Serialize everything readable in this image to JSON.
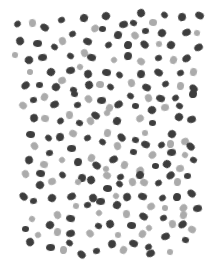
{
  "pattern": {
    "name": "spotted-pattern",
    "background": "#ffffff",
    "colors": {
      "dark": "#3d3d3d",
      "light": "#ababab"
    },
    "dot_size": {
      "dark": [
        8,
        7
      ],
      "light": [
        7,
        7
      ]
    },
    "dots": [
      [
        17,
        24,
        "d"
      ],
      [
        32,
        23,
        "l"
      ],
      [
        44,
        27,
        "d"
      ],
      [
        61,
        20,
        "d"
      ],
      [
        84,
        18,
        "d"
      ],
      [
        95,
        28,
        "l"
      ],
      [
        102,
        29,
        "d"
      ],
      [
        106,
        16,
        "d"
      ],
      [
        123,
        24,
        "d"
      ],
      [
        133,
        23,
        "d"
      ],
      [
        141,
        13,
        "d"
      ],
      [
        153,
        22,
        "l"
      ],
      [
        164,
        15,
        "d"
      ],
      [
        182,
        17,
        "d"
      ],
      [
        199,
        15,
        "d"
      ],
      [
        72,
        34,
        "d"
      ],
      [
        118,
        35,
        "d"
      ],
      [
        135,
        35,
        "l"
      ],
      [
        145,
        31,
        "d"
      ],
      [
        162,
        33,
        "d"
      ],
      [
        186,
        32,
        "d"
      ],
      [
        197,
        33,
        "l"
      ],
      [
        20,
        41,
        "d"
      ],
      [
        37,
        43,
        "d"
      ],
      [
        54,
        47,
        "d"
      ],
      [
        62,
        41,
        "l"
      ],
      [
        87,
        41,
        "d"
      ],
      [
        108,
        45,
        "d"
      ],
      [
        128,
        45,
        "d"
      ],
      [
        144,
        44,
        "d"
      ],
      [
        159,
        44,
        "l"
      ],
      [
        171,
        45,
        "d"
      ],
      [
        198,
        47,
        "d"
      ],
      [
        15,
        55,
        "l"
      ],
      [
        29,
        60,
        "d"
      ],
      [
        42,
        57,
        "d"
      ],
      [
        70,
        56,
        "d"
      ],
      [
        84,
        53,
        "l"
      ],
      [
        91,
        57,
        "d"
      ],
      [
        114,
        60,
        "l"
      ],
      [
        128,
        56,
        "d"
      ],
      [
        141,
        61,
        "l"
      ],
      [
        158,
        58,
        "d"
      ],
      [
        173,
        60,
        "l"
      ],
      [
        186,
        58,
        "d"
      ],
      [
        30,
        72,
        "l"
      ],
      [
        51,
        72,
        "d"
      ],
      [
        70,
        70,
        "d"
      ],
      [
        80,
        67,
        "l"
      ],
      [
        88,
        74,
        "d"
      ],
      [
        106,
        72,
        "d"
      ],
      [
        119,
        75,
        "d"
      ],
      [
        141,
        74,
        "d"
      ],
      [
        158,
        72,
        "d"
      ],
      [
        180,
        73,
        "d"
      ],
      [
        193,
        72,
        "l"
      ],
      [
        25,
        85,
        "d"
      ],
      [
        39,
        85,
        "d"
      ],
      [
        56,
        87,
        "d"
      ],
      [
        62,
        80,
        "l"
      ],
      [
        73,
        90,
        "d"
      ],
      [
        89,
        85,
        "d"
      ],
      [
        100,
        84,
        "l"
      ],
      [
        110,
        87,
        "d"
      ],
      [
        131,
        83,
        "l"
      ],
      [
        146,
        87,
        "d"
      ],
      [
        165,
        84,
        "d"
      ],
      [
        180,
        86,
        "l"
      ],
      [
        193,
        88,
        "d"
      ],
      [
        33,
        100,
        "d"
      ],
      [
        44,
        97,
        "l"
      ],
      [
        54,
        104,
        "d"
      ],
      [
        74,
        94,
        "d"
      ],
      [
        88,
        99,
        "l"
      ],
      [
        101,
        100,
        "d"
      ],
      [
        130,
        96,
        "d"
      ],
      [
        148,
        98,
        "l"
      ],
      [
        160,
        98,
        "d"
      ],
      [
        175,
        98,
        "d"
      ],
      [
        193,
        94,
        "d"
      ],
      [
        23,
        105,
        "l"
      ],
      [
        77,
        105,
        "d"
      ],
      [
        109,
        108,
        "l"
      ],
      [
        118,
        104,
        "d"
      ],
      [
        135,
        106,
        "d"
      ],
      [
        152,
        110,
        "d"
      ],
      [
        165,
        107,
        "l"
      ],
      [
        179,
        106,
        "d"
      ],
      [
        34,
        118,
        "d"
      ],
      [
        45,
        118,
        "l"
      ],
      [
        60,
        121,
        "d"
      ],
      [
        69,
        115,
        "l"
      ],
      [
        95,
        115,
        "d"
      ],
      [
        107,
        113,
        "l"
      ],
      [
        117,
        121,
        "d"
      ],
      [
        140,
        118,
        "l"
      ],
      [
        152,
        123,
        "d"
      ],
      [
        179,
        117,
        "d"
      ],
      [
        191,
        119,
        "d"
      ],
      [
        79,
        123,
        "d"
      ],
      [
        90,
        121,
        "l"
      ],
      [
        30,
        134,
        "d"
      ],
      [
        48,
        138,
        "d"
      ],
      [
        60,
        137,
        "d"
      ],
      [
        73,
        133,
        "l"
      ],
      [
        87,
        138,
        "d"
      ],
      [
        107,
        133,
        "l"
      ],
      [
        121,
        137,
        "d"
      ],
      [
        145,
        133,
        "l"
      ],
      [
        172,
        134,
        "d"
      ],
      [
        185,
        141,
        "l"
      ],
      [
        135,
        140,
        "d"
      ],
      [
        34,
        146,
        "l"
      ],
      [
        71,
        148,
        "d"
      ],
      [
        102,
        142,
        "d"
      ],
      [
        117,
        146,
        "l"
      ],
      [
        145,
        144,
        "d"
      ],
      [
        161,
        145,
        "d"
      ],
      [
        170,
        144,
        "l"
      ],
      [
        190,
        146,
        "d"
      ],
      [
        49,
        153,
        "d"
      ],
      [
        91,
        158,
        "l"
      ],
      [
        113,
        159,
        "d"
      ],
      [
        133,
        152,
        "d"
      ],
      [
        152,
        155,
        "l"
      ],
      [
        171,
        152,
        "d"
      ],
      [
        185,
        155,
        "l"
      ],
      [
        29,
        160,
        "d"
      ],
      [
        44,
        164,
        "l"
      ],
      [
        62,
        160,
        "l"
      ],
      [
        78,
        162,
        "d"
      ],
      [
        96,
        165,
        "d"
      ],
      [
        106,
        169,
        "l"
      ],
      [
        124,
        165,
        "l"
      ],
      [
        140,
        170,
        "l"
      ],
      [
        155,
        166,
        "d"
      ],
      [
        167,
        164,
        "d"
      ],
      [
        180,
        168,
        "l"
      ],
      [
        193,
        160,
        "d"
      ],
      [
        25,
        174,
        "l"
      ],
      [
        40,
        173,
        "d"
      ],
      [
        62,
        175,
        "d"
      ],
      [
        82,
        178,
        "d"
      ],
      [
        107,
        175,
        "l"
      ],
      [
        120,
        177,
        "d"
      ],
      [
        140,
        175,
        "d"
      ],
      [
        170,
        175,
        "d"
      ],
      [
        187,
        176,
        "d"
      ],
      [
        40,
        185,
        "d"
      ],
      [
        52,
        181,
        "l"
      ],
      [
        78,
        182,
        "l"
      ],
      [
        91,
        180,
        "d"
      ],
      [
        107,
        188,
        "d"
      ],
      [
        119,
        184,
        "d"
      ],
      [
        132,
        182,
        "l"
      ],
      [
        144,
        182,
        "l"
      ],
      [
        158,
        183,
        "d"
      ],
      [
        177,
        182,
        "l"
      ],
      [
        23,
        196,
        "d"
      ],
      [
        33,
        201,
        "d"
      ],
      [
        52,
        198,
        "d"
      ],
      [
        71,
        196,
        "d"
      ],
      [
        76,
        206,
        "l"
      ],
      [
        93,
        198,
        "d"
      ],
      [
        100,
        201,
        "d"
      ],
      [
        116,
        196,
        "l"
      ],
      [
        127,
        197,
        "d"
      ],
      [
        142,
        196,
        "d"
      ],
      [
        162,
        198,
        "d"
      ],
      [
        177,
        197,
        "d"
      ],
      [
        191,
        193,
        "d"
      ],
      [
        87,
        205,
        "d"
      ],
      [
        117,
        205,
        "d"
      ],
      [
        151,
        206,
        "l"
      ],
      [
        165,
        208,
        "l"
      ],
      [
        183,
        208,
        "l"
      ],
      [
        197,
        208,
        "d"
      ],
      [
        32,
        219,
        "l"
      ],
      [
        57,
        215,
        "l"
      ],
      [
        70,
        218,
        "d"
      ],
      [
        99,
        213,
        "l"
      ],
      [
        126,
        214,
        "l"
      ],
      [
        143,
        216,
        "d"
      ],
      [
        163,
        218,
        "d"
      ],
      [
        183,
        215,
        "l"
      ],
      [
        182,
        224,
        "d"
      ],
      [
        25,
        229,
        "d"
      ],
      [
        50,
        225,
        "d"
      ],
      [
        70,
        233,
        "d"
      ],
      [
        98,
        226,
        "d"
      ],
      [
        110,
        224,
        "d"
      ],
      [
        131,
        225,
        "d"
      ],
      [
        149,
        228,
        "l"
      ],
      [
        172,
        224,
        "l"
      ],
      [
        192,
        229,
        "l"
      ],
      [
        38,
        235,
        "l"
      ],
      [
        57,
        232,
        "l"
      ],
      [
        90,
        233,
        "l"
      ],
      [
        118,
        235,
        "l"
      ],
      [
        142,
        234,
        "l"
      ],
      [
        165,
        236,
        "d"
      ],
      [
        185,
        240,
        "d"
      ],
      [
        30,
        242,
        "d"
      ],
      [
        50,
        247,
        "d"
      ],
      [
        69,
        243,
        "d"
      ],
      [
        112,
        244,
        "d"
      ],
      [
        133,
        243,
        "d"
      ],
      [
        148,
        247,
        "d"
      ],
      [
        63,
        250,
        "l"
      ],
      [
        81,
        254,
        "d"
      ],
      [
        96,
        251,
        "d"
      ],
      [
        123,
        250,
        "l"
      ],
      [
        150,
        253,
        "d"
      ],
      [
        170,
        252,
        "l"
      ]
    ]
  }
}
